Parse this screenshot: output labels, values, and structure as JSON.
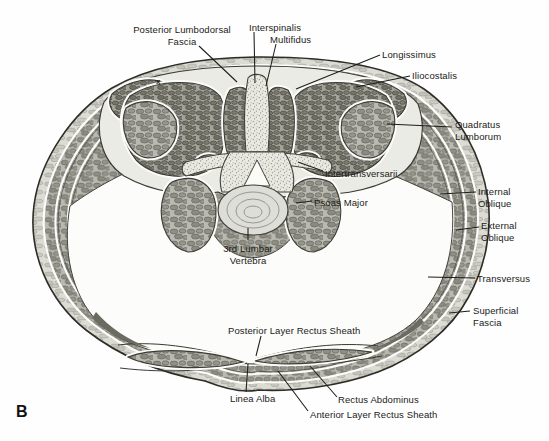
{
  "figure": {
    "panel_letter": "B",
    "annotation_mark": "x"
  },
  "labels": {
    "posterior_lumbodorsal_fascia": "Posterior Lumbodorsal\nFascia",
    "interspinalis": "Interspinalis",
    "multifidus": "Multifidus",
    "longissimus": "Longissimus",
    "iliocostalis": "Iliocostalis",
    "quadratus_lumborum": "Quadratus\nLumborum",
    "intertransversarii": "Intertransversarii",
    "psoas_major": "Psoas Major",
    "third_lumbar_vertebra": "3rd Lumbar\nVertebra",
    "internal_oblique": "Internal\nOblique",
    "external_oblique": "External\nOblique",
    "transversus": "Transversus",
    "superficial_fascia": "Superficial\nFascia",
    "posterior_layer_rectus_sheath": "Posterior Layer Rectus Sheath",
    "linea_alba": "Linea Alba",
    "rectus_abdominus": "Rectus Abdominus",
    "anterior_layer_rectus_sheath": "Anterior Layer Rectus Sheath"
  },
  "colors": {
    "ink": "#1d1d1a",
    "muscle_base": "#b9b9b1",
    "muscle_dark": "#75756b",
    "bone": "#e9e9e2",
    "background": "#fefefe"
  }
}
